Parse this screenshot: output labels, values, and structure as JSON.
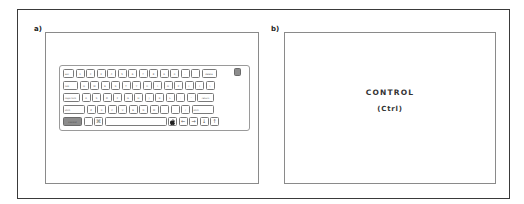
{
  "figure": {
    "panel_a": {
      "label": "a)",
      "keyboard": {
        "highlighted_key": "control",
        "highlight_color": "#8c8c8c",
        "rows": [
          [
            "esc",
            "1",
            "2",
            "3",
            "4",
            "5",
            "6",
            "7",
            "8",
            "9",
            "0",
            "-",
            "=",
            "delete"
          ],
          [
            "tab",
            "Q",
            "W",
            "E",
            "R",
            "T",
            "Y",
            "U",
            "I",
            "O",
            "P",
            "[",
            "]",
            "\\"
          ],
          [
            "caps lock",
            "A",
            "S",
            "D",
            "F",
            "G",
            "H",
            "J",
            "K",
            "L",
            ";",
            "'",
            "return"
          ],
          [
            "shift",
            "Z",
            "X",
            "C",
            "V",
            "B",
            "N",
            "M",
            ",",
            ".",
            "/",
            "shift"
          ],
          [
            "control",
            "option",
            "⌘",
            "",
            "",
            "←",
            "→",
            "↓",
            "↑"
          ]
        ],
        "power_key": "power"
      }
    },
    "panel_b": {
      "label": "b)",
      "title": "CONTROL",
      "abbreviation": "(Ctrl)"
    }
  }
}
